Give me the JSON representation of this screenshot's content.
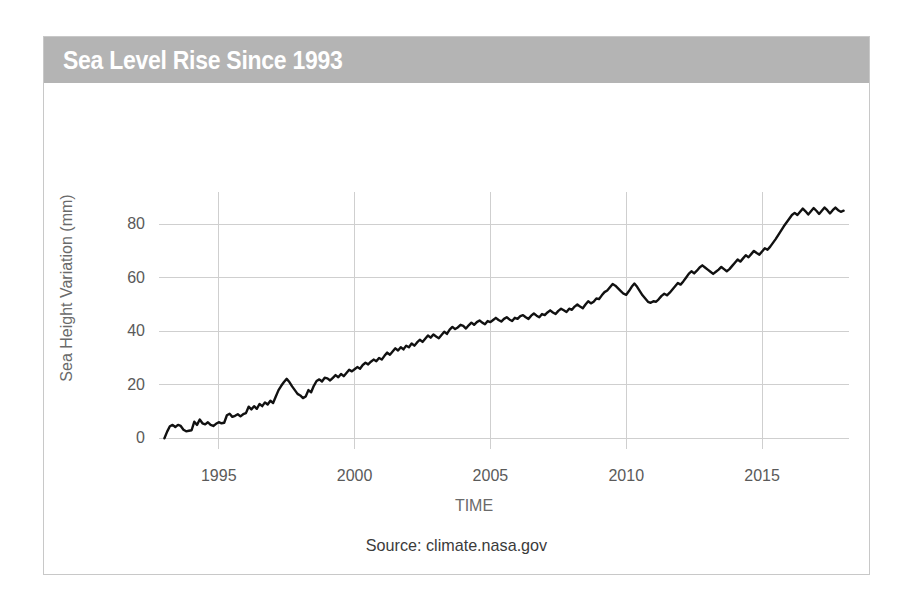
{
  "figure": {
    "title": "Sea Level Rise Since 1993",
    "source_note": "Source: climate.nasa.gov",
    "title_band_color": "#b4b4b4",
    "title_text_color": "#ffffff",
    "border_color": "#c8c8c8",
    "background_color": "#ffffff"
  },
  "chart_data": {
    "type": "line",
    "title": "Sea Level Rise Since 1993",
    "xlabel": "TIME",
    "ylabel": "Sea Height Variation (mm)",
    "xlim": [
      1992.8,
      2018.2
    ],
    "ylim": [
      -4,
      92
    ],
    "xticks": [
      1995,
      2000,
      2005,
      2010,
      2015
    ],
    "xtick_labels": [
      "1995",
      "2000",
      "2005",
      "2010",
      "2015"
    ],
    "yticks": [
      0,
      20,
      40,
      60,
      80
    ],
    "ytick_labels": [
      "0",
      "20",
      "40",
      "60",
      "80"
    ],
    "grid": "both",
    "legend": "none",
    "line_color": "#111111",
    "series": [
      {
        "name": "Sea Height Variation",
        "units": "mm",
        "x": [
          1993.0,
          1993.1,
          1993.2,
          1993.3,
          1993.4,
          1993.5,
          1993.6,
          1993.7,
          1993.8,
          1993.9,
          1994.0,
          1994.1,
          1994.2,
          1994.3,
          1994.4,
          1994.5,
          1994.6,
          1994.7,
          1994.8,
          1994.9,
          1995.0,
          1995.1,
          1995.2,
          1995.3,
          1995.4,
          1995.5,
          1995.6,
          1995.7,
          1995.8,
          1995.9,
          1996.0,
          1996.1,
          1996.2,
          1996.3,
          1996.4,
          1996.5,
          1996.6,
          1996.7,
          1996.8,
          1996.9,
          1997.0,
          1997.1,
          1997.2,
          1997.3,
          1997.4,
          1997.5,
          1997.6,
          1997.7,
          1997.8,
          1997.9,
          1998.0,
          1998.1,
          1998.2,
          1998.3,
          1998.4,
          1998.5,
          1998.6,
          1998.7,
          1998.8,
          1998.9,
          1999.0,
          1999.1,
          1999.2,
          1999.3,
          1999.4,
          1999.5,
          1999.6,
          1999.7,
          1999.8,
          1999.9,
          2000.0,
          2000.1,
          2000.2,
          2000.3,
          2000.4,
          2000.5,
          2000.6,
          2000.7,
          2000.8,
          2000.9,
          2001.0,
          2001.1,
          2001.2,
          2001.3,
          2001.4,
          2001.5,
          2001.6,
          2001.7,
          2001.8,
          2001.9,
          2002.0,
          2002.1,
          2002.2,
          2002.3,
          2002.4,
          2002.5,
          2002.6,
          2002.7,
          2002.8,
          2002.9,
          2003.0,
          2003.1,
          2003.2,
          2003.3,
          2003.4,
          2003.5,
          2003.6,
          2003.7,
          2003.8,
          2003.9,
          2004.0,
          2004.1,
          2004.2,
          2004.3,
          2004.4,
          2004.5,
          2004.6,
          2004.7,
          2004.8,
          2004.9,
          2005.0,
          2005.1,
          2005.2,
          2005.3,
          2005.4,
          2005.5,
          2005.6,
          2005.7,
          2005.8,
          2005.9,
          2006.0,
          2006.1,
          2006.2,
          2006.3,
          2006.4,
          2006.5,
          2006.6,
          2006.7,
          2006.8,
          2006.9,
          2007.0,
          2007.1,
          2007.2,
          2007.3,
          2007.4,
          2007.5,
          2007.6,
          2007.7,
          2007.8,
          2007.9,
          2008.0,
          2008.1,
          2008.2,
          2008.3,
          2008.4,
          2008.5,
          2008.6,
          2008.7,
          2008.8,
          2008.9,
          2009.0,
          2009.1,
          2009.2,
          2009.3,
          2009.4,
          2009.5,
          2009.6,
          2009.7,
          2009.8,
          2009.9,
          2010.0,
          2010.1,
          2010.2,
          2010.3,
          2010.4,
          2010.5,
          2010.6,
          2010.7,
          2010.8,
          2010.9,
          2011.0,
          2011.1,
          2011.2,
          2011.3,
          2011.4,
          2011.5,
          2011.6,
          2011.7,
          2011.8,
          2011.9,
          2012.0,
          2012.1,
          2012.2,
          2012.3,
          2012.4,
          2012.5,
          2012.6,
          2012.7,
          2012.8,
          2012.9,
          2013.0,
          2013.1,
          2013.2,
          2013.3,
          2013.4,
          2013.5,
          2013.6,
          2013.7,
          2013.8,
          2013.9,
          2014.0,
          2014.1,
          2014.2,
          2014.3,
          2014.4,
          2014.5,
          2014.6,
          2014.7,
          2014.8,
          2014.9,
          2015.0,
          2015.1,
          2015.2,
          2015.3,
          2015.4,
          2015.5,
          2015.6,
          2015.7,
          2015.8,
          2015.9,
          2016.0,
          2016.1,
          2016.2,
          2016.3,
          2016.4,
          2016.5,
          2016.6,
          2016.7,
          2016.8,
          2016.9,
          2017.0,
          2017.1,
          2017.2,
          2017.3,
          2017.4,
          2017.5,
          2017.6,
          2017.7,
          2017.8,
          2017.9,
          2018.0
        ],
        "values": [
          0.0,
          2.5,
          4.5,
          5.0,
          4.2,
          5.0,
          4.6,
          3.2,
          2.6,
          2.8,
          3.0,
          6.2,
          5.0,
          7.0,
          5.6,
          5.2,
          6.0,
          5.0,
          4.6,
          5.4,
          6.0,
          5.6,
          5.8,
          8.6,
          9.2,
          8.0,
          8.4,
          9.0,
          8.2,
          9.0,
          9.4,
          11.8,
          10.8,
          12.0,
          11.0,
          12.8,
          12.0,
          13.4,
          12.6,
          14.0,
          13.2,
          15.6,
          18.0,
          19.6,
          21.0,
          22.2,
          21.0,
          19.4,
          18.0,
          16.6,
          16.0,
          15.0,
          15.6,
          18.0,
          17.2,
          19.6,
          21.4,
          22.0,
          21.2,
          22.6,
          22.4,
          21.6,
          22.6,
          23.6,
          22.8,
          24.0,
          23.2,
          24.4,
          25.6,
          25.0,
          25.8,
          26.6,
          26.0,
          27.4,
          28.2,
          27.6,
          28.6,
          29.4,
          28.8,
          30.0,
          29.4,
          30.8,
          32.0,
          31.2,
          32.4,
          33.6,
          32.8,
          34.0,
          33.2,
          34.6,
          34.0,
          35.4,
          34.6,
          35.8,
          36.8,
          36.0,
          37.2,
          38.4,
          37.6,
          38.8,
          38.0,
          37.4,
          38.6,
          39.8,
          39.0,
          40.6,
          41.6,
          40.8,
          41.4,
          42.4,
          42.0,
          41.0,
          42.2,
          43.2,
          42.4,
          43.4,
          44.0,
          43.2,
          42.6,
          43.8,
          43.4,
          44.2,
          45.0,
          44.2,
          43.6,
          44.6,
          45.2,
          44.4,
          43.8,
          45.0,
          44.6,
          45.6,
          46.0,
          45.2,
          44.6,
          45.8,
          46.6,
          45.8,
          45.2,
          46.4,
          46.0,
          47.0,
          47.8,
          47.0,
          46.4,
          47.6,
          48.4,
          47.8,
          47.2,
          48.4,
          48.0,
          49.2,
          50.0,
          49.2,
          48.6,
          50.0,
          51.2,
          50.4,
          51.0,
          52.2,
          52.0,
          53.4,
          54.6,
          55.2,
          56.4,
          57.6,
          57.0,
          56.0,
          55.0,
          54.0,
          53.6,
          55.0,
          56.6,
          57.8,
          56.6,
          55.0,
          53.4,
          52.2,
          51.0,
          50.6,
          51.2,
          51.0,
          52.0,
          53.2,
          54.0,
          53.4,
          54.4,
          55.6,
          56.8,
          58.0,
          57.4,
          58.6,
          60.0,
          61.4,
          62.4,
          61.6,
          62.6,
          63.8,
          64.6,
          63.8,
          63.0,
          62.2,
          61.4,
          62.2,
          63.0,
          64.0,
          63.2,
          62.4,
          63.2,
          64.4,
          65.6,
          66.8,
          66.0,
          67.2,
          68.4,
          67.6,
          68.8,
          70.0,
          69.2,
          68.6,
          69.8,
          71.0,
          70.4,
          71.6,
          73.0,
          74.4,
          76.0,
          77.6,
          79.2,
          80.6,
          82.0,
          83.4,
          84.2,
          83.4,
          84.6,
          85.8,
          84.8,
          83.6,
          84.8,
          86.0,
          85.0,
          83.8,
          85.0,
          86.2,
          85.2,
          84.0,
          85.2,
          86.2,
          85.2,
          84.6,
          85.0
        ]
      }
    ]
  },
  "axes": {
    "ylabel": "Sea Height Variation (mm)",
    "xlabel": "TIME",
    "ytick_labels": [
      "0",
      "20",
      "40",
      "60",
      "80"
    ],
    "xtick_labels": [
      "1995",
      "2000",
      "2005",
      "2010",
      "2015"
    ]
  }
}
